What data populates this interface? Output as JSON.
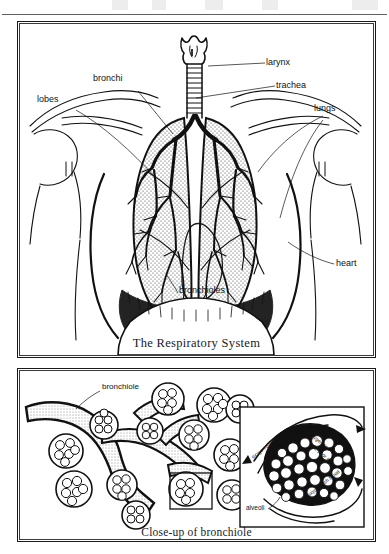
{
  "document": {
    "title": "The Respiratory System",
    "type": "anatomical-diagram",
    "ink_color": "#111111",
    "background_color": "#ffffff"
  },
  "panel_top": {
    "caption": "The Respiratory System",
    "labels": [
      {
        "key": "larynx",
        "text": "larynx"
      },
      {
        "key": "trachea",
        "text": "trachea"
      },
      {
        "key": "lungs",
        "text": "lungs"
      },
      {
        "key": "bronchi",
        "text": "bronchi"
      },
      {
        "key": "lobes",
        "text": "lobes"
      },
      {
        "key": "heart",
        "text": "heart"
      },
      {
        "key": "bronchioles",
        "text": "bronchioles"
      }
    ]
  },
  "panel_bottom": {
    "caption": "Close-up of bronchiole",
    "labels": [
      {
        "key": "bronchiole",
        "text": "bronchiole"
      }
    ],
    "inset": {
      "labels": [
        {
          "key": "alveoli",
          "text": "alveoli"
        },
        {
          "key": "oxygen-poor-blood",
          "text": "oxygen-poor"
        },
        {
          "key": "oxygen-rich-air",
          "text": "oxygen-rich"
        },
        {
          "key": "oxygen-poor-air",
          "text": "O2-poor air"
        },
        {
          "key": "oxygen-rich-blood",
          "text": "oxygen-rich blood"
        }
      ]
    }
  }
}
